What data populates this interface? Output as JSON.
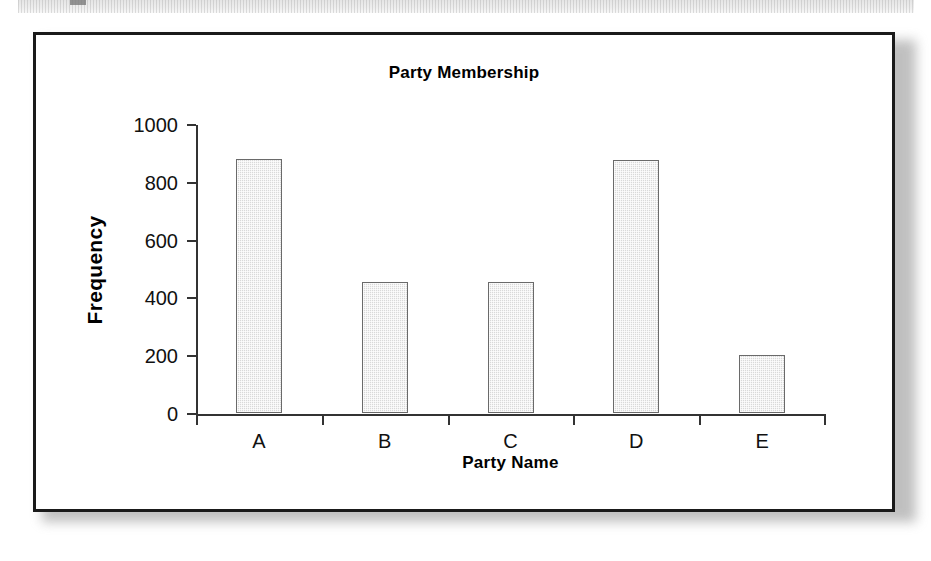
{
  "figure": {
    "frame_color": "#1a1a1a",
    "background": "#ffffff"
  },
  "scan_artifact": {
    "name": "cut-off-text-band",
    "description": ""
  },
  "chart_data": {
    "type": "bar",
    "title": "Party Membership",
    "xlabel": "Party Name",
    "ylabel": "Frequency",
    "categories": [
      "A",
      "B",
      "C",
      "D",
      "E"
    ],
    "values": [
      880,
      455,
      455,
      875,
      200
    ],
    "ylim": [
      0,
      1000
    ],
    "ytick_labels": [
      "0",
      "200",
      "400",
      "600",
      "800",
      "1000"
    ],
    "ytick_values": [
      0,
      200,
      400,
      600,
      800,
      1000
    ],
    "grid": false,
    "legend": null,
    "bar_fill_color": "#d9d9d9",
    "bar_edge_color": "#6a6a6a"
  }
}
